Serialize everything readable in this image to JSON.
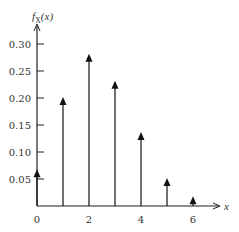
{
  "chart_data": {
    "type": "stem",
    "title": "",
    "ylabel": "f_X(x)",
    "ylabel_main": "f",
    "ylabel_sub": "X",
    "ylabel_arg": "(x)",
    "xlabel": "x",
    "x": [
      0,
      1,
      2,
      3,
      4,
      5,
      6
    ],
    "values": [
      0.066,
      0.2,
      0.28,
      0.23,
      0.135,
      0.05,
      0.016
    ],
    "yticks": [
      "0.05",
      "0.10",
      "0.15",
      "0.20",
      "0.25",
      "0.30"
    ],
    "ytick_values": [
      0.05,
      0.1,
      0.15,
      0.2,
      0.25,
      0.3
    ],
    "xticks": [
      "0",
      "2",
      "4",
      "6"
    ],
    "xtick_values": [
      0,
      2,
      4,
      6
    ],
    "ylim": [
      0,
      0.33
    ],
    "xlim": [
      0,
      7
    ],
    "grid": false,
    "legend": null,
    "stem_marker": "arrow"
  },
  "colors": {
    "stem": "#111111",
    "axis": "#222222",
    "text": "#333333"
  }
}
